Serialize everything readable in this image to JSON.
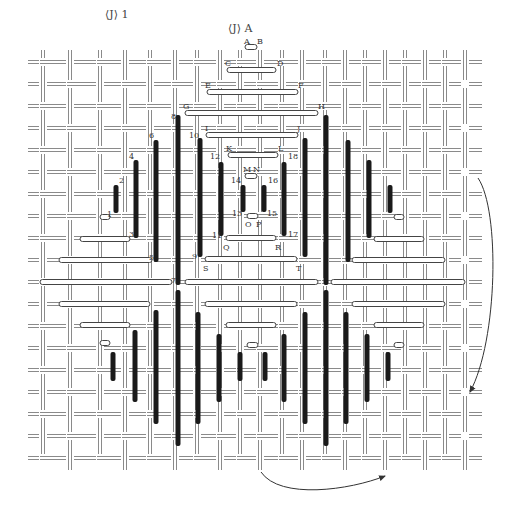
{
  "figure": {
    "title_left": "⟨J⟩ 1",
    "title_center": "⟨J⟩ A",
    "colors": {
      "grid_line": "#8a8a8a",
      "bar_dark": "#1a1a1a",
      "bar_light_fill": "#ffffff",
      "bar_light_stroke": "#444444",
      "arrow": "#333333"
    }
  },
  "grid": {
    "vertical_x": [
      43,
      70,
      100,
      125,
      150,
      175,
      197,
      220,
      240,
      260,
      282,
      302,
      325,
      345,
      365,
      385,
      405,
      425,
      445,
      465
    ],
    "horizontal_y": [
      62,
      84,
      106,
      128,
      150,
      172,
      194,
      216,
      238,
      260,
      282,
      304,
      326,
      348,
      370,
      392,
      414,
      436,
      458
    ]
  },
  "dark_bars": [
    {
      "x": 116,
      "y1": 185,
      "y2": 213
    },
    {
      "x": 136,
      "y1": 160,
      "y2": 238
    },
    {
      "x": 156,
      "y1": 140,
      "y2": 262
    },
    {
      "x": 178,
      "y1": 115,
      "y2": 285
    },
    {
      "x": 200,
      "y1": 138,
      "y2": 257
    },
    {
      "x": 221,
      "y1": 162,
      "y2": 236
    },
    {
      "x": 243,
      "y1": 185,
      "y2": 212
    },
    {
      "x": 264,
      "y1": 185,
      "y2": 212
    },
    {
      "x": 284,
      "y1": 162,
      "y2": 236
    },
    {
      "x": 305,
      "y1": 138,
      "y2": 257
    },
    {
      "x": 326,
      "y1": 115,
      "y2": 285
    },
    {
      "x": 348,
      "y1": 140,
      "y2": 262
    },
    {
      "x": 369,
      "y1": 160,
      "y2": 238
    },
    {
      "x": 390,
      "y1": 185,
      "y2": 213
    },
    {
      "x": 113,
      "y1": 352,
      "y2": 381
    },
    {
      "x": 135,
      "y1": 330,
      "y2": 402
    },
    {
      "x": 156,
      "y1": 310,
      "y2": 424
    },
    {
      "x": 178,
      "y1": 290,
      "y2": 446
    },
    {
      "x": 198,
      "y1": 312,
      "y2": 424
    },
    {
      "x": 219,
      "y1": 334,
      "y2": 402
    },
    {
      "x": 240,
      "y1": 352,
      "y2": 381
    },
    {
      "x": 265,
      "y1": 352,
      "y2": 381
    },
    {
      "x": 284,
      "y1": 334,
      "y2": 402
    },
    {
      "x": 305,
      "y1": 312,
      "y2": 424
    },
    {
      "x": 326,
      "y1": 290,
      "y2": 446
    },
    {
      "x": 346,
      "y1": 312,
      "y2": 424
    },
    {
      "x": 367,
      "y1": 334,
      "y2": 402
    },
    {
      "x": 388,
      "y1": 352,
      "y2": 381
    }
  ],
  "light_bars": [
    {
      "x1": 245,
      "x2": 257,
      "y": 47
    },
    {
      "x1": 227,
      "x2": 276,
      "y": 70
    },
    {
      "x1": 207,
      "x2": 298,
      "y": 92
    },
    {
      "x1": 185,
      "x2": 318,
      "y": 113
    },
    {
      "x1": 206,
      "x2": 298,
      "y": 135
    },
    {
      "x1": 228,
      "x2": 278,
      "y": 155
    },
    {
      "x1": 245,
      "x2": 257,
      "y": 176
    },
    {
      "x1": 247,
      "x2": 258,
      "y": 216
    },
    {
      "x1": 226,
      "x2": 276,
      "y": 238
    },
    {
      "x1": 205,
      "x2": 297,
      "y": 259
    },
    {
      "x1": 40,
      "x2": 172,
      "y": 282
    },
    {
      "x1": 185,
      "x2": 318,
      "y": 282
    },
    {
      "x1": 331,
      "x2": 465,
      "y": 282
    },
    {
      "x1": 100,
      "x2": 110,
      "y": 217
    },
    {
      "x1": 80,
      "x2": 130,
      "y": 239
    },
    {
      "x1": 59,
      "x2": 152,
      "y": 260
    },
    {
      "x1": 394,
      "x2": 404,
      "y": 217
    },
    {
      "x1": 374,
      "x2": 424,
      "y": 239
    },
    {
      "x1": 352,
      "x2": 445,
      "y": 260
    },
    {
      "x1": 59,
      "x2": 150,
      "y": 304
    },
    {
      "x1": 80,
      "x2": 130,
      "y": 325
    },
    {
      "x1": 100,
      "x2": 110,
      "y": 343
    },
    {
      "x1": 205,
      "x2": 297,
      "y": 304
    },
    {
      "x1": 226,
      "x2": 276,
      "y": 325
    },
    {
      "x1": 247,
      "x2": 258,
      "y": 345
    },
    {
      "x1": 352,
      "x2": 445,
      "y": 304
    },
    {
      "x1": 374,
      "x2": 424,
      "y": 325
    },
    {
      "x1": 394,
      "x2": 404,
      "y": 345
    }
  ],
  "labels": [
    {
      "text": "A",
      "x": 244,
      "y": 38
    },
    {
      "text": "B",
      "x": 257,
      "y": 38
    },
    {
      "text": "C",
      "x": 225,
      "y": 60
    },
    {
      "text": "D",
      "x": 277,
      "y": 60
    },
    {
      "text": "E",
      "x": 205,
      "y": 82
    },
    {
      "text": "F",
      "x": 298,
      "y": 82
    },
    {
      "text": "G",
      "x": 183,
      "y": 103
    },
    {
      "text": "H",
      "x": 318,
      "y": 103
    },
    {
      "text": "I",
      "x": 205,
      "y": 125
    },
    {
      "text": "J",
      "x": 297,
      "y": 125
    },
    {
      "text": "K",
      "x": 226,
      "y": 145
    },
    {
      "text": "L",
      "x": 278,
      "y": 145
    },
    {
      "text": "M",
      "x": 243,
      "y": 166
    },
    {
      "text": "N",
      "x": 253,
      "y": 166
    },
    {
      "text": "O",
      "x": 245,
      "y": 221
    },
    {
      "text": "P",
      "x": 256,
      "y": 221
    },
    {
      "text": "Q",
      "x": 223,
      "y": 244
    },
    {
      "text": "R",
      "x": 275,
      "y": 244
    },
    {
      "text": "S",
      "x": 203,
      "y": 265
    },
    {
      "text": "T",
      "x": 296,
      "y": 265
    },
    {
      "text": "2",
      "x": 119,
      "y": 177
    },
    {
      "text": "4",
      "x": 129,
      "y": 153
    },
    {
      "text": "6",
      "x": 149,
      "y": 132
    },
    {
      "text": "8",
      "x": 171,
      "y": 113
    },
    {
      "text": "10",
      "x": 189,
      "y": 132
    },
    {
      "text": "12",
      "x": 210,
      "y": 153
    },
    {
      "text": "14",
      "x": 231,
      "y": 177
    },
    {
      "text": "16",
      "x": 268,
      "y": 177
    },
    {
      "text": "18",
      "x": 288,
      "y": 153
    },
    {
      "text": "1",
      "x": 107,
      "y": 211
    },
    {
      "text": "3",
      "x": 129,
      "y": 231
    },
    {
      "text": "5",
      "x": 149,
      "y": 254
    },
    {
      "text": "7",
      "x": 171,
      "y": 277
    },
    {
      "text": "9",
      "x": 192,
      "y": 253
    },
    {
      "text": "11",
      "x": 212,
      "y": 232
    },
    {
      "text": "13",
      "x": 232,
      "y": 210
    },
    {
      "text": "15",
      "x": 267,
      "y": 210
    },
    {
      "text": "17",
      "x": 288,
      "y": 231
    }
  ],
  "arrows": [
    {
      "name": "right-curved-arrow",
      "path": "M478,178 C500,210 498,340 470,392"
    },
    {
      "name": "bottom-curved-arrow",
      "path": "M261,472 C280,500 350,490 385,476"
    }
  ]
}
